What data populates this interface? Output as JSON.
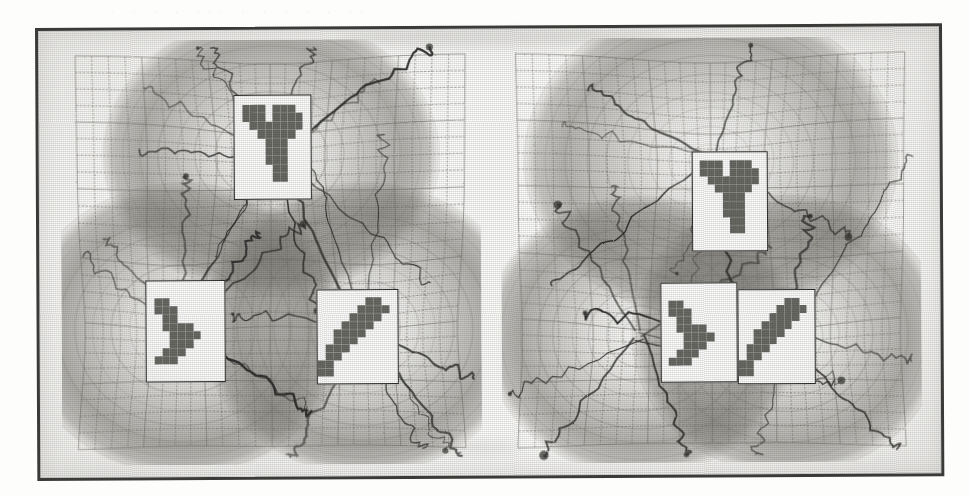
{
  "figure": {
    "kind": "scanned-grayscale-figure",
    "caption_ghost_text": "·  ·    · ·   ···  ·  · ·  ·   ·  ··",
    "panel_count": 2,
    "background_color": "#fdfdfc",
    "ink_color": "#3a3a38",
    "mesh_color": "#6e6c66",
    "basin_color": "#7c7a74",
    "pattern_pixel_color": "#6b6b66"
  },
  "chart_data": {
    "type": "contour",
    "title": "",
    "subtitle": "",
    "xlabel": "",
    "ylabel": "",
    "grid": true,
    "legend": "none",
    "panels": [
      {
        "name": "panel-left",
        "label": "",
        "mesh": {
          "cols": 24,
          "rows": 24,
          "cell_px": 17,
          "warped": true
        },
        "axis_ranges": {
          "xlim": [
            -1,
            1
          ],
          "ylim": [
            -1,
            1
          ]
        },
        "basins": [
          {
            "id": "basin-top",
            "cx": 0.5,
            "cy": 0.27,
            "rx": 0.27,
            "ry": 0.23,
            "depth": 0.88
          },
          {
            "id": "basin-bottom-left",
            "cx": 0.29,
            "cy": 0.68,
            "rx": 0.26,
            "ry": 0.24,
            "depth": 0.92
          },
          {
            "id": "basin-bottom-right",
            "cx": 0.72,
            "cy": 0.68,
            "rx": 0.26,
            "ry": 0.24,
            "depth": 0.92
          }
        ],
        "attractor_count": 3,
        "trajectory_count": 27,
        "prototypes": [
          {
            "id": "proto-top",
            "cx": 0.505,
            "cy": 0.253,
            "w": 0.185,
            "h": 0.245,
            "glyph": "seven"
          },
          {
            "id": "proto-bottom-left",
            "cx": 0.295,
            "cy": 0.685,
            "w": 0.19,
            "h": 0.24,
            "glyph": "diag-left"
          },
          {
            "id": "proto-bottom-right",
            "cx": 0.705,
            "cy": 0.7,
            "w": 0.195,
            "h": 0.225,
            "glyph": "stair"
          }
        ]
      },
      {
        "name": "panel-right",
        "label": "",
        "mesh": {
          "cols": 24,
          "rows": 24,
          "cell_px": 17,
          "warped": true
        },
        "axis_ranges": {
          "xlim": [
            -1,
            1
          ],
          "ylim": [
            -1,
            1
          ]
        },
        "basins": [
          {
            "id": "basin-top",
            "cx": 0.5,
            "cy": 0.29,
            "rx": 0.3,
            "ry": 0.26,
            "depth": 0.84
          },
          {
            "id": "basin-bottom-left",
            "cx": 0.33,
            "cy": 0.7,
            "rx": 0.25,
            "ry": 0.23,
            "depth": 0.9
          },
          {
            "id": "basin-bottom-right",
            "cx": 0.68,
            "cy": 0.7,
            "rx": 0.25,
            "ry": 0.23,
            "depth": 0.9
          }
        ],
        "attractor_count": 3,
        "trajectory_count": 24,
        "prototypes": [
          {
            "id": "proto-upper",
            "cx": 0.545,
            "cy": 0.385,
            "w": 0.18,
            "h": 0.235,
            "glyph": "seven"
          },
          {
            "id": "proto-lower-left",
            "cx": 0.47,
            "cy": 0.695,
            "w": 0.185,
            "h": 0.235,
            "glyph": "diag-left"
          },
          {
            "id": "proto-lower-right",
            "cx": 0.655,
            "cy": 0.705,
            "w": 0.185,
            "h": 0.225,
            "glyph": "stair"
          }
        ]
      }
    ],
    "glyph_bitmaps": {
      "seven": {
        "cols": 10,
        "rows": 12,
        "rows_bits": [
          "0000000000",
          "0111011100",
          "0111011110",
          "0011111110",
          "0001111100",
          "0000111000",
          "0000111000",
          "0000111000",
          "0000011000",
          "0000011000",
          "0000000000",
          "0000000000"
        ]
      },
      "diag-left": {
        "cols": 10,
        "rows": 12,
        "rows_bits": [
          "0000000000",
          "0000000000",
          "0110000000",
          "0111000000",
          "0011000000",
          "0011110000",
          "0001111000",
          "0001110000",
          "0011100000",
          "0111000000",
          "0000000000",
          "0000000000"
        ]
      },
      "stair": {
        "cols": 10,
        "rows": 12,
        "rows_bits": [
          "0000000000",
          "0000001100",
          "0000011110",
          "0000111100",
          "0001111000",
          "0011110000",
          "0011100000",
          "0111000000",
          "0110000000",
          "1100000000",
          "1100000000",
          "0000000000"
        ]
      }
    }
  }
}
